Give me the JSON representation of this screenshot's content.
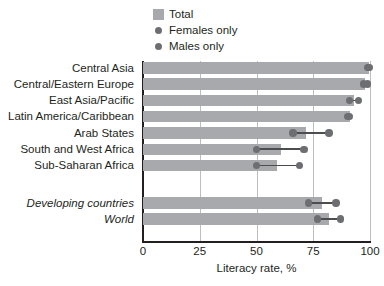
{
  "legend": {
    "items": [
      {
        "label": "Total",
        "marker": "square-swatch-icon"
      },
      {
        "label": "Females only",
        "marker": "dot-marker-icon"
      },
      {
        "label": "Males only",
        "marker": "dot-marker-icon"
      }
    ]
  },
  "colors": {
    "bar": "#a7a9ac",
    "dot": "#6d6e71",
    "connector": "#4d4d4f",
    "grid": "#bcbec0",
    "axis": "#231f20",
    "background": "#ffffff"
  },
  "chart_data": {
    "type": "bar",
    "title": "",
    "xlabel": "Literacy rate, %",
    "ylabel": "",
    "xlim": [
      0,
      100
    ],
    "xticks": [
      0,
      25,
      50,
      75,
      100
    ],
    "grid": true,
    "legend_position": "top-center",
    "orientation": "horizontal",
    "categories": [
      "Central Asia",
      "Central/Eastern Europe",
      "East Asia/Pacific",
      "Latin America/Caribbean",
      "Arab States",
      "South and West Africa",
      "Sub-Saharan Africa",
      "Developing countries",
      "World"
    ],
    "category_styles": [
      "normal",
      "normal",
      "normal",
      "normal",
      "normal",
      "normal",
      "normal",
      "italic",
      "italic"
    ],
    "series": [
      {
        "name": "Total",
        "type": "bar",
        "values": [
          99.5,
          98,
          93,
          91,
          72,
          61,
          59,
          79,
          82
        ]
      },
      {
        "name": "Females only",
        "type": "dot",
        "values": [
          99,
          97,
          91,
          90,
          66,
          50,
          50,
          73,
          77
        ]
      },
      {
        "name": "Males only",
        "type": "dot",
        "values": [
          99.5,
          99,
          95,
          91,
          82,
          71,
          69,
          85,
          87
        ]
      }
    ]
  }
}
